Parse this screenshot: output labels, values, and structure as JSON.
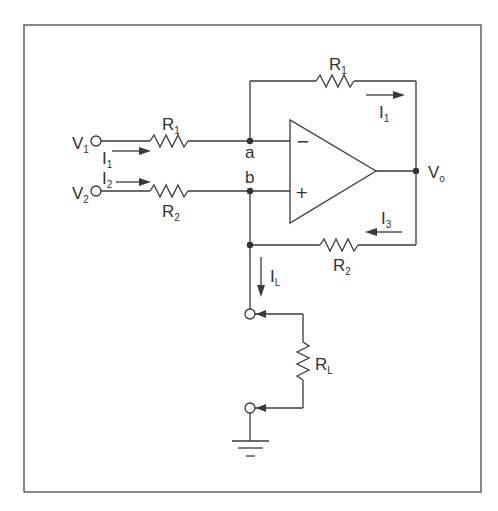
{
  "diagram": {
    "type": "circuit-schematic",
    "inputs": [
      {
        "id": "V1",
        "label": "V",
        "sub": "1"
      },
      {
        "id": "V2",
        "label": "V",
        "sub": "2"
      }
    ],
    "output": {
      "id": "Vo",
      "label": "V",
      "sub": "o"
    },
    "nodes": {
      "a": "a",
      "b": "b"
    },
    "opamp": {
      "inverting": "−",
      "noninverting": "+"
    },
    "resistors": [
      {
        "id": "R1_in",
        "label": "R",
        "sub": "1"
      },
      {
        "id": "R2_in",
        "label": "R",
        "sub": "2"
      },
      {
        "id": "R1_fb",
        "label": "R",
        "sub": "1"
      },
      {
        "id": "R2_fb",
        "label": "R",
        "sub": "2"
      },
      {
        "id": "RL",
        "label": "R",
        "sub": "L"
      }
    ],
    "currents": [
      {
        "id": "I1_in",
        "label": "I",
        "sub": "1"
      },
      {
        "id": "I2",
        "label": "I",
        "sub": "2"
      },
      {
        "id": "I1_fb",
        "label": "I",
        "sub": "1"
      },
      {
        "id": "I3",
        "label": "I",
        "sub": "3"
      },
      {
        "id": "IL",
        "label": "I",
        "sub": "L"
      }
    ],
    "ground": "ground-symbol"
  }
}
